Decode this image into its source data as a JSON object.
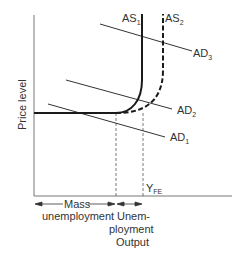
{
  "diagram": {
    "type": "aggregate-supply-aggregate-demand",
    "axes": {
      "y_label": "Price level",
      "x_label": "Output"
    },
    "curves": {
      "as1": {
        "label": "AS",
        "sub": "1",
        "style": "solid"
      },
      "as2": {
        "label": "AS",
        "sub": "2",
        "style": "dashed"
      },
      "ad1": {
        "label": "AD",
        "sub": "1"
      },
      "ad2": {
        "label": "AD",
        "sub": "2"
      },
      "ad3": {
        "label": "AD",
        "sub": "3"
      }
    },
    "markers": {
      "yfe": {
        "label": "Y",
        "sub": "FE"
      }
    },
    "regions": {
      "mass": {
        "line1": "Mass",
        "line2": "unemployment"
      },
      "unemp": {
        "line1": "Unem-",
        "line2": "ployment"
      }
    },
    "colors": {
      "line": "#1a1a1a",
      "axis": "#555555",
      "text": "#333333"
    }
  }
}
